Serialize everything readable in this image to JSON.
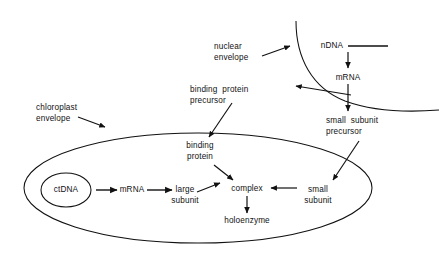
{
  "figure": {
    "type": "biology-pathway-diagram",
    "title_visible": false,
    "background_color": "#ffffff",
    "stroke_color": "#111111",
    "canvas": {
      "width": 439,
      "height": 259
    }
  },
  "compartments": [
    {
      "id": "chloroplast",
      "name": "chloroplast",
      "shape": "ellipse",
      "label": "chloroplast\nenvelope",
      "label_line1": "chloroplast",
      "label_line2": "envelope"
    },
    {
      "id": "nucleus",
      "name": "nucleus",
      "shape": "open-curve",
      "label": "nuclear\nenvelope",
      "label_line1": "nuclear",
      "label_line2": "envelope"
    }
  ],
  "nodes": [
    {
      "id": "ctdna",
      "label": "ctDNA",
      "line1": "ctDNA",
      "line2": "",
      "compartment": "chloroplast"
    },
    {
      "id": "ct_mrna",
      "label": "mRNA",
      "line1": "mRNA",
      "line2": "",
      "compartment": "chloroplast"
    },
    {
      "id": "large_subunit",
      "label": "large subunit",
      "line1": "large",
      "line2": "subunit",
      "compartment": "chloroplast"
    },
    {
      "id": "complex",
      "label": "complex",
      "line1": "complex",
      "line2": "",
      "compartment": "chloroplast"
    },
    {
      "id": "small_subunit",
      "label": "small subunit",
      "line1": "small",
      "line2": "subunit",
      "compartment": "chloroplast"
    },
    {
      "id": "holoenzyme",
      "label": "holoenzyme",
      "line1": "holoenzyme",
      "line2": "",
      "compartment": "chloroplast"
    },
    {
      "id": "binding_protein",
      "label": "binding protein",
      "line1": "binding",
      "line2": "protein",
      "compartment": "chloroplast"
    },
    {
      "id": "ndna",
      "label": "nDNA",
      "line1": "nDNA",
      "line2": "",
      "compartment": "nucleus"
    },
    {
      "id": "n_mrna",
      "label": "mRNA",
      "line1": "mRNA",
      "line2": "",
      "compartment": "nucleus"
    },
    {
      "id": "binding_protein_precursor",
      "label": "binding protein precursor",
      "line1": "binding  protein",
      "line2": "precursor",
      "compartment": "cytosol"
    },
    {
      "id": "small_subunit_precursor",
      "label": "small subunit precursor",
      "line1": "small  subunit",
      "line2": "precursor",
      "compartment": "cytosol"
    }
  ],
  "edges": [
    {
      "from": "ndna",
      "to": "n_mrna",
      "kind": "transcription"
    },
    {
      "from": "n_mrna",
      "to": "binding_protein_precursor",
      "kind": "translation"
    },
    {
      "from": "n_mrna",
      "to": "small_subunit_precursor",
      "kind": "translation"
    },
    {
      "from": "binding_protein_precursor",
      "to": "binding_protein",
      "kind": "import"
    },
    {
      "from": "small_subunit_precursor",
      "to": "small_subunit",
      "kind": "import"
    },
    {
      "from": "ctdna",
      "to": "ct_mrna",
      "kind": "transcription"
    },
    {
      "from": "ct_mrna",
      "to": "large_subunit",
      "kind": "translation"
    },
    {
      "from": "large_subunit",
      "to": "complex",
      "kind": "assembly"
    },
    {
      "from": "binding_protein",
      "to": "complex",
      "kind": "assembly"
    },
    {
      "from": "small_subunit",
      "to": "complex",
      "kind": "assembly"
    },
    {
      "from": "complex",
      "to": "holoenzyme",
      "kind": "maturation"
    }
  ],
  "annotations": [
    {
      "id": "ndna_strand",
      "description": "horizontal DNA strand line to the right of nDNA"
    }
  ]
}
